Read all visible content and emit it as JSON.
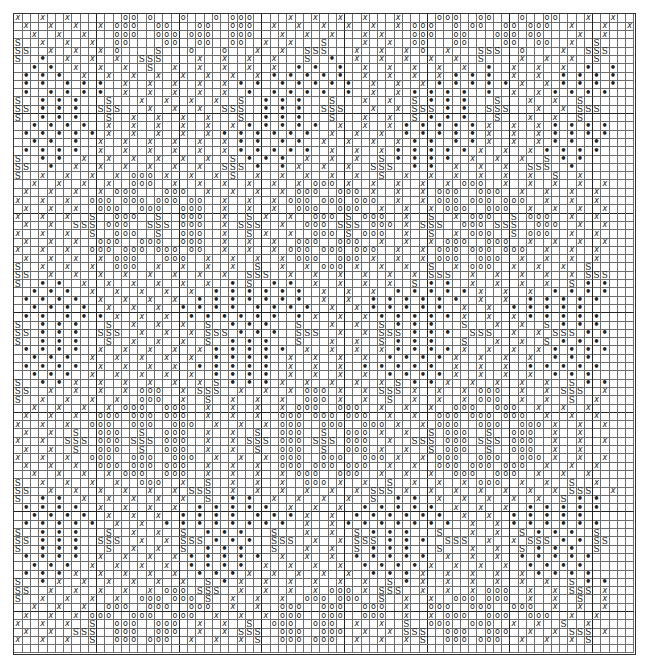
{
  "chart": {
    "title": "",
    "cols": 75,
    "rows": 77,
    "heavy_line_every": 10,
    "legend": {
      "x": "x",
      "o": "o",
      ".": "•",
      "s": "S",
      " ": ""
    },
    "grid": [
      "x  x  x      oo o   o   o ooo    x  x  x  x   x    ooo  oo   o  oo   x  x ",
      " x  x  x  x ooo  oo   oo  ooo  x  x  x  x  x  x ooo  o oo  oo ooo  x   x  x",
      "  x  x  x   ooo  ooo ooo  ooo   x  x  x   x x   ooo  oo   ooo oo    x  x   ",
      "s  x  x  x  oo    oo  oo  oo  x  x   s    x  x  oo   oo    oo  oo  x  s   ",
      "ss  x  x  x o    s   o   o   x  x  sss   x  x  x o  x   sss  o    x  sss  ",
      "s  .  x  x  x  sss    x  x  x  x   s  .  x  x  x  x  x  s    x  x  x  s   ",
      "  . .  x  x  x  s  x  x  x  x  x  . .  .  x  x  x  x  x  .  x  x  x  .  . ",
      " . . .  x  x  x  x  x  x  x  x . . . . .  x  x  x  x . . .  x  x  . . . . ",
      " . .  . . .  x  x  x  x  x . .  . . . . .  x  x  x . . . . . x  x . . . . ",
      " .  . . . .  x  x  x  x  x  .  . . . .  .  x  x . . . .  .  x  x . . . . ",
      "s  . . .   s   x  x  x  x  s  . . .   s   x  x  s . . .   s   x  x  s    ",
      "ss . . .  sss   x  x  x  sss  . . .  sss   x  x sss . .  sss   x  x sss   ",
      "s  . . .   s  x  x  x  x   s  . . .   s   x  x  s . . .   s   x  x  s    ",
      "  . . . .  x  x  x  x  x  x . . . . .  x  x  x . . . . . x  x  x . . . . ",
      " . . . . . x  x  x  x  x . . . . . .  x  x  x  . . . . . x  x  x . . . . ",
      "  . .  .  x  x  x  x  x  x . .  . .  x  x  x  x . .  . . x  x  x . .  .  ",
      " . . . .  x  x  x  x  x  x . . . . .  x  x  x . . . . . x  x  x . . . . ",
      "s  . .  x  x  x  x  x  x  s . . .  x  x  x  s . . . .  x  x  x  s . .   ",
      "ss  .  x  x  x  x  x  x  sss .  . x  x  x  sss  . .  x  x  x  sss  .    ",
      "s  x  x  x  x ooo x  x  x s  x  x  x  x  x  s  x  x  x  x  x  x  s  x  ",
      "  x  x  x  x  ooo  x  x  x  x  x  x ooo x  x  x  x  x ooo  x  x  x  x  x",
      " x  x  x  x ooo   ooo  x  x  x  x ooo  ooo x  x  x ooo  ooo  x  x  x  x ",
      "x  x  x  ooo ooo ooo oo  x  x  x ooo ooo ooo  x  x ooo ooo ooo  x  x  x ",
      " x  x  x  ooo  ooo  ooo  x  x  x  ooo  ooo  x  x  x ooo  ooo  x  x  x  x",
      "x  x  x  s  ooo  s  ooo  x  s x  x  ooo s ooo  x  s  x ooo  s ooo  x  x ",
      " x  x  sss ooo  sss ooo  x sss  x  ooo sss ooo x sss  ooo sss  ooo  x  x",
      "x  x  x  s  ooo  s  ooo  x  s x  x  ooo s ooo  x  s  x ooo  s ooo  x  x ",
      " x  x  x  ooo  ooo  ooo  x  x  x  ooo  ooo  x  x  x ooo  ooo  x  x  x  x",
      "x  x  x  ooo ooo ooo oo  x  x  x ooo ooo ooo  x  x ooo ooo ooo  x  x  x ",
      " x  x  x  x ooo   ooo  x  x  x  x ooo  ooo x  x  x ooo  ooo  x  x  x  x ",
      "s  x  x  x  ooo  x  x  x  x  s  x  x ooo x  x  x  s  x ooo  x  x  x  s  ",
      "ss  x  x  x  x  x  x  x  x  sss  x  x  x  x  x  x sss  x  x  x  x  x sss ",
      "s  . .  x  x  x  x  x  x  . s  . .  x  x  x  x  s . .  x  x  x  x  s . .",
      "  . . .  x  x  x  x  x  . . . . . .  x  x  x  . . . . . x  x  x  . . . . ",
      " . . . .  x  x  x  x  . . . . . . .  x  x  . . . . . .  x  x  . . . . . ",
      "  . . . .  x  x  x  . . . .  . . . .  x  x . . . . .  x  x  . . . . .  ",
      " . .  . . . x  x  x  . . . . . .  . x  x  x . . . . . x  x  x . . . . . ",
      "s  . . .   s  x  x  x  s  . . .   s   x  x  s . . .   s   x  x  s . . .",
      "ss . . .  sss  x  x  x sss . . .  sss  x  x sss . . .  sss  x  x sss . . ",
      "s  . . .   s  x  x  x  s  . . .   s   x  x  s . . .   s   x  x  s . . .",
      " . . . .  x  x  x  x  x . . . . .  x  x  x  x . . . . x  x  x  x . . . . ",
      "  . . .  x  x  x  x  x  . . . .  x  x  x  x  . . . . x  x  x  x  . . .  ",
      " . . . .  x  x  x  x  . . . . .  x  x  x  . . . . .  x  x  x  . . . . . ",
      "  . . .  x  x  x  x  x  . . . .  x  x  x  x  . . . . x  x  x  x  . . .  ",
      "s  . . x  x  x  x  x  x s . . . x  x  x  x  x s . . x  x  x  x  x  s . .",
      "ss  x  x  x  x ooo  x sss  x  x  x ooo x  x sss x  x  x ooo  x  x sss  x",
      "s  x  x  x  x  ooo  x  s  x  x  x  ooo x  x  s  x  x  x ooo  x  x  s  x ",
      "  x  x  x  x ooo  ooo  x  x  x  x ooo  ooo  x  x  x  ooo  ooo  x  x  x  ",
      " x  x  x  ooo ooo ooo  x  x  x  ooo ooo ooo  x  x  ooo ooo ooo  x  x  x ",
      "x  x  x  ooo  ooo  ooo  x  x  x ooo  ooo  ooo x  x ooo  ooo  ooo x  x  x",
      " x  x  s  ooo  s  ooo  x  x  s  ooo  s  ooo x  x  s ooo  s  ooo  x  x  ",
      "x  x  sss ooo sss ooo  x  x sss ooo sss ooo  x  sss ooo sss ooo  x  x  x",
      " x  x  s  ooo  s  ooo  x  x  s  ooo  s  ooo x  x  s ooo  s  ooo  x  x  ",
      "x  x  x  ooo  ooo  ooo  x  x  x ooo  ooo  ooo x  x ooo  ooo  ooo x  x  x",
      " x  x  x  ooo ooo ooo  x  x  x  ooo ooo ooo  x  x  ooo ooo ooo  x  x  x ",
      "  x  x  x  x ooo  ooo  x  x  x  x ooo  ooo  x  x  x  ooo  ooo  x  x  x  ",
      "s  x  x  x  x  ooo  x  s  x  x  x  ooo x  x  s  x  x  x ooo  x  x  s  x ",
      "ss  x  x  x  x  x  x sss  x  x  x  x  x  x sss x  x  x  x  x  x  x sss  x",
      "s  . .  x  x  x  x  x  s  . .  x  x  x  x  s  . .  x  x  x  x  x  s . . ",
      " . . . .  x  x  x  x  . . . . .  x  x  x  . . . . .  x  x  x  . . . . . ",
      "  . . . .  x  x  x  . . . .  . . . x  x  . . . . . .  x  x  . . . . .  ",
      " . . . . .  x  x  . . . . . . . .  x  x . . . . . . .  x  x . . . . . . ",
      "s  . . .   s  x  x  s  . . .   s   x  x  s . . .   s   x  x  s . . .  s ",
      "ss . . .  sss  x  x sss . . .  sss  x  x sss . . .  sss  x  x sss . . ss",
      "s  . . .   s  x  x  s  . . .   s   x  x  s . . .   s   x  x  s . . .  s ",
      " . . . .  x  x  x  x . . . . .  x  x  x  . . . . .  x  x  x  . . . . . ",
      "  . . .  x  x  x  x  . . . .  x  x  x  x  . . . . x  x  x  x  . . . .  ",
      " . . . x  x  x  x  x  . . . x  x  x  x  x  . . . x  x  x  x  x . . . . ",
      "s  . x  x  x  x  x  x  s . x  x  x  x  x  x  s . x  x  x  x  x  x  s . .",
      "ss  x  x  x  x  x ooo sss  x  x  x  x ooo x sss  x  x  x ooo  x  x sss x",
      "s  x  x  x  x  ooo ooo s  x  x  x  ooo ooo  s  x  x  ooo ooo  x  x  s  x",
      "  x  x  x  ooo  ooo  ooo  x  x  ooo  ooo  ooo  x  ooo  ooo  ooo  x  x  x",
      " x  x  x ooo  ooo  ooo  x  x  x ooo  ooo  ooo  x  x ooo  ooo  ooo  x  x ",
      "x  x  x  s  ooo  ooo  x  x  s  ooo  ooo  x  x  s  ooo  ooo  x  x  s  x  ",
      " x  x  sss  ooo  ooo  x  x sss  ooo  ooo  x  x sss  ooo  ooo  x  x sss x",
      "x  x  x  s  ooo ooo  x  x  x s  ooo ooo  x  x  x s  ooo ooo  x  x  x s  "
    ]
  }
}
